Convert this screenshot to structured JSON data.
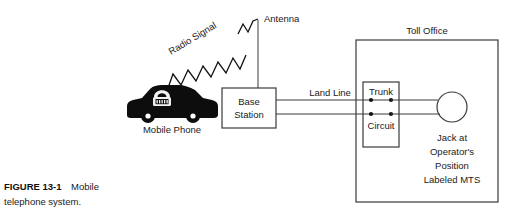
{
  "figure": {
    "caption_bold": "FIGURE 13-1",
    "caption_rest": "Mobile",
    "caption_line2": "telephone system."
  },
  "labels": {
    "radio_signal": "Radio Signal",
    "antenna": "Antenna",
    "mobile_phone": "Mobile Phone",
    "base_station_line1": "Base",
    "base_station_line2": "Station",
    "land_line": "Land Line",
    "toll_office": "Toll Office",
    "trunk": "Trunk",
    "circuit": "Circuit",
    "jack_line1": "Jack at",
    "jack_line2": "Operator's",
    "jack_line3": "Position",
    "jack_line4": "Labeled MTS"
  },
  "colors": {
    "background": "#ffffff",
    "stroke": "#3a3a3a",
    "ink": "#111111",
    "car": "#0d0d0d",
    "phone_glyph": "#f2f2f2"
  },
  "geometry": {
    "width": 518,
    "height": 219,
    "toll_office_box": {
      "x": 356,
      "y": 40,
      "w": 142,
      "h": 162
    },
    "trunk_circuit_box": {
      "x": 363,
      "y": 82,
      "w": 36,
      "h": 65
    },
    "base_station_box": {
      "x": 222,
      "y": 88,
      "w": 54,
      "h": 40
    },
    "jack_circle": {
      "cx": 452,
      "cy": 107,
      "r": 15
    },
    "antenna": {
      "x": 258,
      "y_top": 18,
      "y_bottom": 88
    },
    "land_line_y": [
      100,
      114
    ],
    "trunk_dots": [
      {
        "x": 371,
        "y": 100
      },
      {
        "x": 391,
        "y": 100
      },
      {
        "x": 371,
        "y": 114
      },
      {
        "x": 391,
        "y": 114
      }
    ]
  }
}
